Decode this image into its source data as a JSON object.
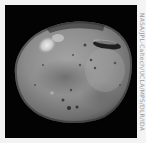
{
  "image": {
    "subject": "asteroid Vesta",
    "background_color": "#030303",
    "border_color": "#f2f2f2",
    "body_base_color": "#8a8a8a"
  },
  "credit": {
    "text": "NASA/JPL-Caltech/UCLA/MPS/DLR/IDA"
  }
}
